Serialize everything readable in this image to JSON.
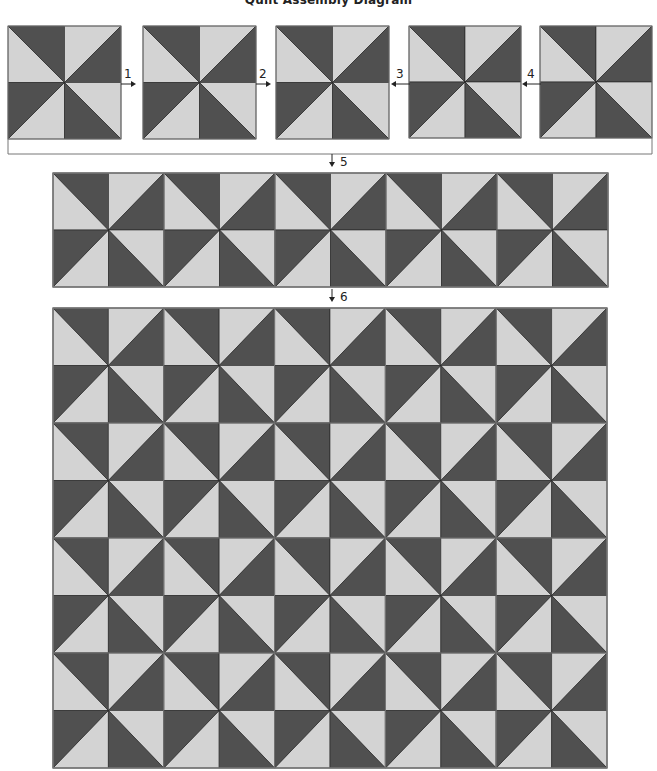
{
  "title": "Quilt Assembly Diagram",
  "colors": {
    "dark": "#505050",
    "light": "#d3d3d3",
    "line": "#222222",
    "border": "#777777"
  },
  "block_pattern": {
    "name": "pinwheel",
    "quadrants": {
      "TL": {
        "diagonal": "tl-br",
        "dark_half": "upper-right"
      },
      "TR": {
        "diagonal": "bl-tr",
        "dark_half": "lower-right"
      },
      "BL": {
        "diagonal": "tr-bl",
        "dark_half": "upper-left"
      },
      "BR": {
        "diagonal": "tl-br",
        "dark_half": "lower-left"
      }
    }
  },
  "step_blocks": [
    {
      "x": 8,
      "y": 26,
      "size": 113
    },
    {
      "x": 143,
      "y": 26,
      "size": 113
    },
    {
      "x": 276,
      "y": 26,
      "size": 113
    },
    {
      "x": 409,
      "y": 26,
      "size": 112
    },
    {
      "x": 540,
      "y": 26,
      "size": 112
    }
  ],
  "steps": [
    {
      "label": "1",
      "arrow": "right",
      "x": 127,
      "y": 84
    },
    {
      "label": "2",
      "arrow": "right",
      "x": 262,
      "y": 84
    },
    {
      "label": "3",
      "arrow": "left",
      "x": 400,
      "y": 84
    },
    {
      "label": "4",
      "arrow": "left",
      "x": 531,
      "y": 84
    },
    {
      "label": "5",
      "arrow": "down",
      "x": 332,
      "y": 161
    },
    {
      "label": "6",
      "arrow": "down",
      "x": 332,
      "y": 296
    }
  ],
  "row_strip": {
    "x": 53,
    "y": 173,
    "width": 555,
    "height": 114,
    "blocks_across": 5,
    "blocks_down": 1
  },
  "quilt_top": {
    "x": 53,
    "y": 308,
    "width": 554,
    "height": 460,
    "blocks_across": 5,
    "blocks_down": 4
  }
}
